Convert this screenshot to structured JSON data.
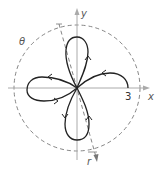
{
  "diagram": {
    "labels": {
      "x_axis": "x",
      "y_axis": "y",
      "r_axis": "r",
      "angle": "θ",
      "radius_value": "3"
    },
    "colors": {
      "curve": "#222222",
      "axes": "#999999",
      "dashed": "#777777"
    },
    "petals": [
      "right",
      "top",
      "left",
      "bottom"
    ]
  }
}
